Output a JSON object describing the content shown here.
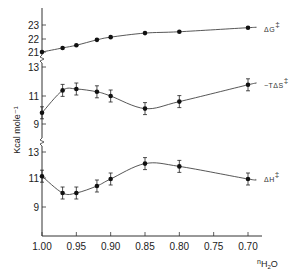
{
  "chart_data": {
    "type": "line",
    "title": "",
    "xlabel": "n_H2O",
    "xlabel_main": "n",
    "xlabel_sub": "H",
    "xlabel_sub2": "2",
    "xlabel_tail": "O",
    "ylabel": "Kcal mole⁻¹",
    "x_ticks": [
      "1.00",
      "0.95",
      "0.90",
      "0.85",
      "0.80",
      "0.75",
      "0.70"
    ],
    "x_tick_values": [
      1.0,
      0.95,
      0.9,
      0.85,
      0.8,
      0.75,
      0.7
    ],
    "xlim": [
      1.0,
      0.68
    ],
    "x_reversed": true,
    "grid": false,
    "legend_position": "inline-right",
    "x": [
      1.0,
      0.97,
      0.95,
      0.92,
      0.9,
      0.85,
      0.8,
      0.7
    ],
    "panels": [
      {
        "name": "dG",
        "y_ticks": [
          "23",
          "22",
          "21"
        ],
        "y_tick_values": [
          23,
          22,
          21
        ],
        "ylim": [
          21,
          23.5
        ],
        "series": [
          {
            "name": "ΔG‡",
            "label": "ΔG",
            "values": [
              21.0,
              21.3,
              21.5,
              21.9,
              22.1,
              22.4,
              22.5,
              22.8
            ],
            "error_bars": false
          }
        ]
      },
      {
        "name": "TdS",
        "y_ticks": [
          "13",
          "11",
          "9"
        ],
        "y_tick_values": [
          13,
          11,
          9
        ],
        "ylim": [
          9,
          13
        ],
        "series": [
          {
            "name": "−TΔS‡",
            "label": "−TΔS",
            "values": [
              9.8,
              11.4,
              11.5,
              11.3,
              11.0,
              10.1,
              10.6,
              11.8
            ],
            "error_bars": true
          }
        ]
      },
      {
        "name": "dH",
        "y_ticks": [
          "13",
          "11",
          "9"
        ],
        "y_tick_values": [
          13,
          11,
          9
        ],
        "ylim": [
          8,
          13
        ],
        "series": [
          {
            "name": "ΔH‡",
            "label": "ΔH",
            "values": [
              11.2,
              10.0,
              10.0,
              10.5,
              11.0,
              12.1,
              11.9,
              11.0
            ],
            "error_bars": true
          }
        ]
      }
    ],
    "dagger": "‡"
  }
}
